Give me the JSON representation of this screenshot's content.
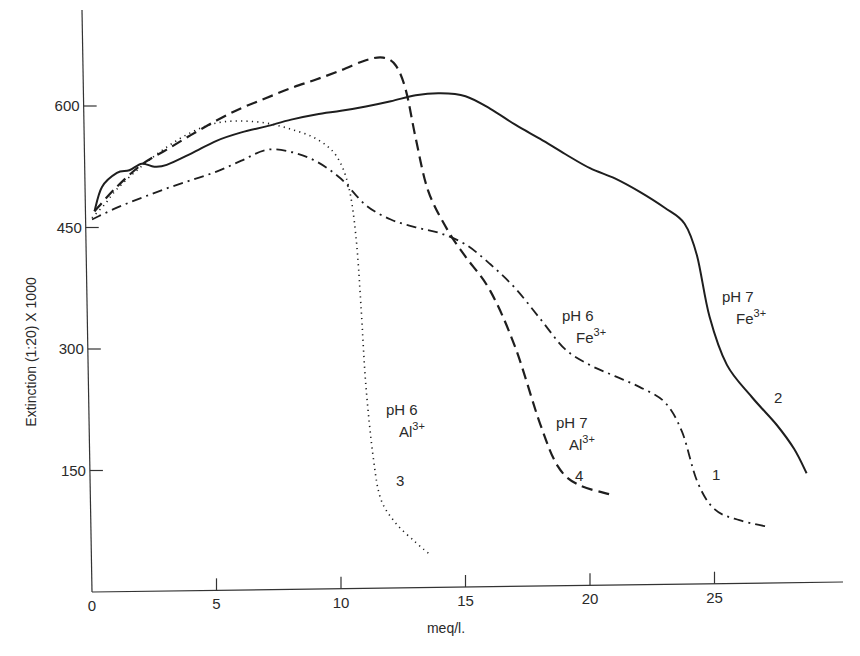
{
  "chart_data": {
    "type": "line",
    "title": "",
    "xlabel": "meq/l.",
    "ylabel": "Extinction (1:20) X 1000",
    "xlim": [
      0,
      30
    ],
    "ylim": [
      0,
      720
    ],
    "x_ticks": [
      0,
      5,
      10,
      15,
      20,
      25
    ],
    "x_tick_labels": [
      "0",
      "5",
      "10",
      "15",
      "20",
      "25"
    ],
    "y_ticks": [
      150,
      300,
      450,
      600
    ],
    "y_tick_labels": [
      "150",
      "300",
      "450",
      "600"
    ],
    "grid": false,
    "legend": "none (curves labelled directly)",
    "series": [
      {
        "name": "1",
        "label": "pH 6 Fe3+",
        "style": "dash-dot",
        "points": [
          [
            0,
            460
          ],
          [
            1,
            474
          ],
          [
            2,
            486
          ],
          [
            3,
            497
          ],
          [
            4,
            507
          ],
          [
            5,
            517
          ],
          [
            6,
            530
          ],
          [
            7,
            543
          ],
          [
            8,
            540
          ],
          [
            9,
            528
          ],
          [
            10,
            506
          ],
          [
            11,
            473
          ],
          [
            12,
            455
          ],
          [
            13,
            445
          ],
          [
            14,
            437
          ],
          [
            15,
            423
          ],
          [
            16,
            398
          ],
          [
            17,
            368
          ],
          [
            18,
            330
          ],
          [
            19,
            292
          ],
          [
            20,
            272
          ],
          [
            21,
            258
          ],
          [
            22,
            244
          ],
          [
            23,
            225
          ],
          [
            23.7,
            188
          ],
          [
            24.3,
            127
          ],
          [
            25,
            92
          ],
          [
            26,
            78
          ],
          [
            27.2,
            69
          ]
        ]
      },
      {
        "name": "2",
        "label": "pH 7 Fe3+",
        "style": "solid",
        "points": [
          [
            0.1,
            470
          ],
          [
            0.4,
            500
          ],
          [
            1,
            517
          ],
          [
            1.5,
            520
          ],
          [
            2,
            528
          ],
          [
            2.5,
            524
          ],
          [
            3,
            526
          ],
          [
            4,
            540
          ],
          [
            5,
            555
          ],
          [
            6,
            565
          ],
          [
            7,
            572
          ],
          [
            8,
            580
          ],
          [
            9,
            586
          ],
          [
            10,
            590
          ],
          [
            11,
            595
          ],
          [
            12,
            601
          ],
          [
            13,
            608
          ],
          [
            14,
            610
          ],
          [
            15,
            606
          ],
          [
            16,
            590
          ],
          [
            17,
            570
          ],
          [
            18,
            552
          ],
          [
            19,
            533
          ],
          [
            20,
            515
          ],
          [
            21,
            502
          ],
          [
            22,
            485
          ],
          [
            23,
            465
          ],
          [
            23.8,
            445
          ],
          [
            24.3,
            405
          ],
          [
            24.8,
            330
          ],
          [
            25.5,
            270
          ],
          [
            26.5,
            230
          ],
          [
            27.5,
            195
          ],
          [
            28.2,
            165
          ],
          [
            28.7,
            135
          ]
        ]
      },
      {
        "name": "3",
        "label": "pH 6 Al3+",
        "style": "dotted",
        "points": [
          [
            0,
            462
          ],
          [
            0.5,
            478
          ],
          [
            1,
            497
          ],
          [
            2,
            525
          ],
          [
            3,
            548
          ],
          [
            4,
            566
          ],
          [
            5,
            577
          ],
          [
            6,
            579
          ],
          [
            7,
            576
          ],
          [
            8,
            568
          ],
          [
            9,
            556
          ],
          [
            9.8,
            535
          ],
          [
            10.3,
            497
          ],
          [
            10.6,
            435
          ],
          [
            10.8,
            350
          ],
          [
            11,
            250
          ],
          [
            11.3,
            160
          ],
          [
            11.6,
            110
          ],
          [
            12.2,
            80
          ],
          [
            13,
            56
          ],
          [
            13.6,
            40
          ]
        ]
      },
      {
        "name": "4",
        "label": "pH 7 Al3+",
        "style": "dashed",
        "points": [
          [
            0.1,
            470
          ],
          [
            1,
            500
          ],
          [
            2,
            527
          ],
          [
            3,
            545
          ],
          [
            4,
            563
          ],
          [
            5,
            580
          ],
          [
            6,
            595
          ],
          [
            7,
            607
          ],
          [
            8,
            619
          ],
          [
            9,
            629
          ],
          [
            10,
            640
          ],
          [
            11,
            652
          ],
          [
            11.7,
            655
          ],
          [
            12.2,
            645
          ],
          [
            12.6,
            615
          ],
          [
            13,
            555
          ],
          [
            13.5,
            490
          ],
          [
            14.3,
            440
          ],
          [
            15,
            408
          ],
          [
            16,
            365
          ],
          [
            17,
            295
          ],
          [
            18,
            200
          ],
          [
            18.7,
            148
          ],
          [
            19.5,
            125
          ],
          [
            20.8,
            112
          ]
        ]
      }
    ],
    "annotations": [
      {
        "text": "pH 6",
        "sub": "Fe",
        "sup": "3+",
        "series": "1"
      },
      {
        "text": "pH 7",
        "sub": "Fe",
        "sup": "3+",
        "series": "2"
      },
      {
        "text": "pH 6",
        "sub": "Al",
        "sup": "3+",
        "series": "3"
      },
      {
        "text": "pH 7",
        "sub": "Al",
        "sup": "3+",
        "series": "4"
      },
      {
        "text": "1",
        "series": "1"
      },
      {
        "text": "2",
        "series": "2"
      },
      {
        "text": "3",
        "series": "3"
      },
      {
        "text": "4",
        "series": "4"
      }
    ]
  },
  "labels": {
    "ph6_fe": {
      "line1": "pH 6",
      "el": "Fe",
      "sup": "3+"
    },
    "ph7_fe": {
      "line1": "pH 7",
      "el": "Fe",
      "sup": "3+"
    },
    "ph6_al": {
      "line1": "pH 6",
      "el": "Al",
      "sup": "3+"
    },
    "ph7_al": {
      "line1": "pH 7",
      "el": "Al",
      "sup": "3+"
    },
    "num1": "1",
    "num2": "2",
    "num3": "3",
    "num4": "4"
  }
}
